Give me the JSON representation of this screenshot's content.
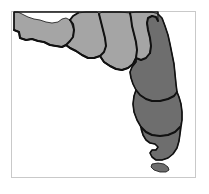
{
  "figure": {
    "caption": "",
    "background_color": "#ffffff"
  },
  "frame": {
    "name": "plot-border",
    "color": "#c9c9c9",
    "x": 11,
    "y": 11,
    "width": 185,
    "height": 167
  },
  "map": {
    "subject": "Florida",
    "outline_color": "#111111",
    "outline_width": 1.6,
    "divider_color": "#111111",
    "divider_width": 2.0,
    "shading_legend": [
      {
        "key": "light",
        "label": "Light gray region",
        "color": "#a5a5a5"
      },
      {
        "key": "dark",
        "label": "Dark gray region",
        "color": "#6e6e6e"
      }
    ],
    "regions": [
      {
        "name": "panhandle-west",
        "shade": "light",
        "color": "#a5a5a5",
        "path": "M 14 12 L 14 30 L 19 32 L 20 38 L 26 40 L 32 39 L 38 41 L 44 42 L 50 45 L 56 46 L 62 47 L 66 45 L 70 41 L 73 37 L 74 30 L 73 24 L 70 20 L 66 18 L 62 19 L 58 22 L 52 23 L 46 22 L 40 20 L 34 19 L 28 17 L 22 14 L 18 12 Z"
      },
      {
        "name": "north-central-a",
        "shade": "light",
        "color": "#a5a5a5",
        "path": "M 70 20 L 74 30 L 73 37 L 70 41 L 66 45 L 70 48 L 76 51 L 82 55 L 88 58 L 94 58 L 100 56 L 104 52 L 106 46 L 105 38 L 103 30 L 101 22 L 99 14 L 97 12 L 86 12 L 78 13 L 73 16 Z"
      },
      {
        "name": "north-central-b",
        "shade": "light",
        "color": "#a5a5a5",
        "path": "M 99 14 L 101 22 L 103 30 L 105 38 L 106 46 L 104 52 L 100 56 L 104 62 L 110 66 L 116 69 L 122 70 L 128 68 L 133 64 L 136 58 L 137 50 L 136 42 L 134 34 L 132 26 L 131 18 L 130 13 L 120 12 L 110 12 L 102 12 Z"
      },
      {
        "name": "northeast-corner",
        "shade": "light",
        "color": "#a5a5a5",
        "path": "M 130 13 L 131 18 L 132 26 L 134 34 L 136 42 L 137 50 L 136 58 L 141 60 L 146 58 L 150 53 L 151 46 L 150 38 L 148 30 L 147 23 L 148 18 L 152 16 L 156 17 L 158 21 L 158 14 L 152 12 L 144 12 L 136 12 Z"
      },
      {
        "name": "peninsula-east-upper",
        "shade": "dark",
        "color": "#6e6e6e",
        "path": "M 158 21 L 158 14 L 162 18 L 165 26 L 168 35 L 170 44 L 172 54 L 174 64 L 175 74 L 176 84 L 177 92 L 174 96 L 168 99 L 160 101 L 152 101 L 146 99 L 140 95 L 136 90 L 133 84 L 131 78 L 130 72 L 132 67 L 136 62 L 136 58 L 141 60 L 146 58 L 150 53 L 151 46 L 150 38 L 148 30 L 147 23 L 148 18 L 152 16 L 156 17 Z"
      },
      {
        "name": "peninsula-east-mid",
        "shade": "dark",
        "color": "#6e6e6e",
        "path": "M 177 92 L 174 96 L 168 99 L 160 101 L 152 101 L 146 99 L 140 95 L 136 90 L 134 96 L 133 104 L 134 112 L 137 120 L 141 127 L 146 132 L 152 135 L 160 136 L 168 135 L 175 132 L 180 127 L 182 120 L 182 112 L 181 104 L 179 97 Z"
      },
      {
        "name": "peninsula-south-tip",
        "shade": "dark",
        "color": "#6e6e6e",
        "path": "M 141 127 L 146 132 L 152 135 L 160 136 L 168 135 L 175 132 L 180 127 L 180 134 L 179 141 L 177 148 L 173 154 L 168 158 L 162 160 L 156 160 L 152 157 L 150 153 L 152 150 L 156 150 L 158 147 L 155 144 L 150 143 L 146 140 L 143 135 L 141 130 Z"
      },
      {
        "name": "florida-keys-island",
        "shade": "dark",
        "color": "#6e6e6e",
        "path": "M 152 164 L 158 163 L 164 164 L 168 167 L 169 170 L 166 172 L 160 172 L 154 170 L 151 167 Z"
      }
    ],
    "divider_lines": [
      {
        "name": "divider-panhandle-east",
        "path": "M 70 20 L 73 16 L 78 13"
      },
      {
        "name": "divider-panhandle-south",
        "path": "M 14 30 L 19 32 L 20 38 L 26 40 L 32 39 L 38 41 L 44 42 L 50 45 L 56 46 L 62 47 L 66 45 L 70 41 L 73 37 L 74 30 L 73 24 L 70 20"
      },
      {
        "name": "divider-north-a-b",
        "path": "M 99 14 L 101 22 L 103 30 L 105 38 L 106 46 L 104 52 L 100 56"
      },
      {
        "name": "divider-north-b-ne",
        "path": "M 130 13 L 131 18 L 132 26 L 134 34 L 136 42 L 137 50 L 136 58"
      },
      {
        "name": "divider-north-south-a",
        "path": "M 66 45 L 70 48 L 76 51 L 82 55 L 88 58 L 94 58 L 100 56 L 104 62 L 110 66 L 116 69 L 122 70 L 128 68 L 133 64 L 136 58 L 141 60 L 146 58 L 150 53"
      },
      {
        "name": "divider-ne-east",
        "path": "M 150 53 L 151 46 L 150 38 L 148 30 L 147 23 L 148 18 L 152 16 L 156 17 L 158 21"
      },
      {
        "name": "divider-east-mid",
        "path": "M 177 92 L 174 96 L 168 99 L 160 101 L 152 101 L 146 99 L 140 95 L 136 90"
      },
      {
        "name": "divider-mid-tip",
        "path": "M 141 127 L 146 132 L 152 135 L 160 136 L 168 135 L 175 132 L 180 127"
      }
    ],
    "outline_path": "M 14 12 L 14 30 L 19 32 L 20 38 L 26 40 L 32 39 L 38 41 L 44 42 L 50 45 L 56 46 L 62 47 L 66 45 L 70 48 L 76 51 L 82 55 L 88 58 L 94 58 L 100 56 L 104 62 L 110 66 L 116 69 L 122 70 L 128 68 L 133 64 L 136 58 L 136 62 L 132 67 L 130 72 L 131 78 L 133 84 L 136 90 L 134 96 L 133 104 L 134 112 L 137 120 L 141 127 L 143 135 L 146 140 L 150 143 L 155 144 L 158 147 L 156 150 L 152 150 L 150 153 L 152 157 L 156 160 L 162 160 L 168 158 L 173 154 L 177 148 L 179 141 L 180 134 L 182 120 L 182 112 L 181 104 L 179 97 L 177 92 L 176 84 L 175 74 L 174 64 L 172 54 L 170 44 L 168 35 L 165 26 L 162 18 L 158 14 L 158 12 Z"
  }
}
